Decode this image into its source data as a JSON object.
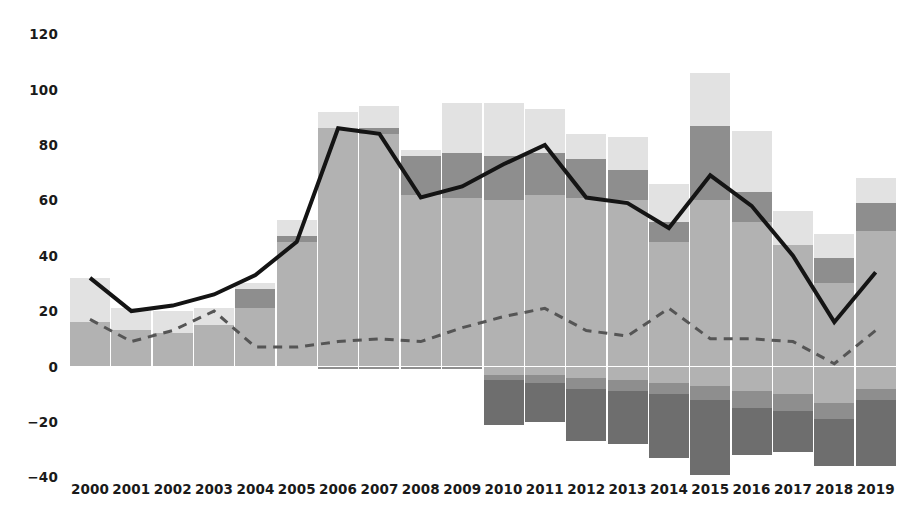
{
  "chart_data": {
    "type": "bar",
    "title": "",
    "subtitle": "",
    "xlabel": "",
    "ylabel": "",
    "ylim": [
      -40,
      120
    ],
    "grid": false,
    "legend_position": "none",
    "stacked": true,
    "categories": [
      "2000",
      "2001",
      "2002",
      "2003",
      "2004",
      "2005",
      "2006",
      "2007",
      "2008",
      "2009",
      "2010",
      "2011",
      "2012",
      "2013",
      "2014",
      "2015",
      "2016",
      "2017",
      "2018",
      "2019"
    ],
    "y_ticks": [
      120,
      100,
      80,
      60,
      40,
      20,
      0,
      -20,
      -40
    ],
    "y_tick_labels": [
      "120",
      "100",
      "80",
      "60",
      "40",
      "20",
      "0",
      "−20",
      "−40"
    ],
    "colors": {
      "positive_base": "#b2b2b2",
      "positive_mid": "#8e8e8e",
      "positive_top": "#e2e2e2",
      "negative_light": "#b2b2b2",
      "negative_mid": "#8e8e8e",
      "negative_dark": "#6e6e6e",
      "solid_line": "#141414",
      "dashed_line": "#555555",
      "text": "#1a1a1a",
      "background": "#ffffff"
    },
    "series": [
      {
        "name": "positive-base",
        "stack": "positive",
        "order": 1,
        "color": "#b2b2b2",
        "values": [
          16,
          13,
          12,
          15,
          21,
          45,
          86,
          84,
          62,
          61,
          60,
          62,
          61,
          60,
          45,
          60,
          52,
          44,
          30,
          49
        ]
      },
      {
        "name": "positive-mid",
        "stack": "positive",
        "order": 2,
        "color": "#8e8e8e",
        "values": [
          0,
          0,
          0,
          0,
          7,
          2,
          0,
          2,
          14,
          16,
          16,
          15,
          14,
          11,
          7,
          27,
          11,
          0,
          9,
          10
        ]
      },
      {
        "name": "positive-top",
        "stack": "positive",
        "order": 3,
        "color": "#e2e2e2",
        "values": [
          16,
          8,
          8,
          6,
          2,
          6,
          6,
          8,
          2,
          18,
          19,
          16,
          9,
          12,
          14,
          19,
          22,
          12,
          9,
          9
        ]
      },
      {
        "name": "negative-light",
        "stack": "negative",
        "order": 1,
        "color": "#b2b2b2",
        "values": [
          0,
          0,
          0,
          0,
          0,
          0,
          0,
          0,
          0,
          0,
          3,
          3,
          4,
          5,
          6,
          7,
          9,
          10,
          13,
          8
        ]
      },
      {
        "name": "negative-mid",
        "stack": "negative",
        "order": 2,
        "color": "#8e8e8e",
        "values": [
          0,
          0,
          0,
          0,
          0,
          0,
          1,
          1,
          1,
          1,
          2,
          3,
          4,
          4,
          4,
          5,
          6,
          6,
          6,
          4
        ]
      },
      {
        "name": "negative-dark",
        "stack": "negative",
        "order": 3,
        "color": "#6e6e6e",
        "values": [
          0,
          0,
          0,
          0,
          0,
          0,
          0,
          0,
          0,
          0,
          16,
          14,
          19,
          19,
          23,
          27,
          17,
          15,
          17,
          24
        ]
      }
    ],
    "lines": [
      {
        "name": "solid-total-line",
        "style": "solid",
        "color": "#141414",
        "width": 4,
        "values": [
          32,
          20,
          22,
          26,
          33,
          45,
          86,
          84,
          61,
          65,
          73,
          80,
          61,
          59,
          50,
          69,
          58,
          40,
          16,
          34
        ]
      },
      {
        "name": "dashed-line",
        "style": "dashed",
        "color": "#555555",
        "width": 3,
        "values": [
          17,
          9,
          13,
          20,
          7,
          7,
          9,
          10,
          9,
          14,
          18,
          21,
          13,
          11,
          21,
          10,
          10,
          9,
          1,
          13
        ]
      }
    ]
  },
  "axes": {
    "y_axis_name": "value-axis",
    "x_axis_name": "year-axis"
  }
}
